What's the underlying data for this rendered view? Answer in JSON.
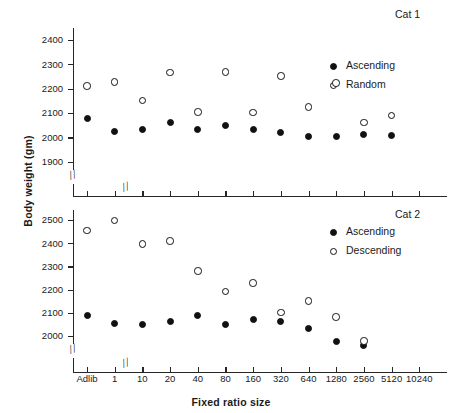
{
  "figure": {
    "ylabel": "Body weight (gm)",
    "xlabel": "Fixed ratio size",
    "axis_break_glyph": "//"
  },
  "chart_data": [
    {
      "type": "scatter",
      "title": "Cat 1",
      "xlabel": "Fixed ratio size",
      "ylabel": "Body weight (gm)",
      "categories": [
        "Adlib",
        "1",
        "10",
        "20",
        "40",
        "80",
        "160",
        "320",
        "640",
        "1280",
        "2560",
        "5120",
        "10240"
      ],
      "yticks": [
        1900,
        2000,
        2100,
        2200,
        2300,
        2400
      ],
      "ylim": [
        1860,
        2450
      ],
      "grid": false,
      "axis_break_y": true,
      "axis_break_x_after": "1",
      "legend_position": "upper-right",
      "series": [
        {
          "name": "Ascending",
          "marker": "filled-circle",
          "values": [
            2080,
            2025,
            2033,
            2062,
            2033,
            2050,
            2036,
            2021,
            2006,
            2007,
            2013,
            2010,
            null
          ]
        },
        {
          "name": "Random",
          "marker": "open-circle",
          "values": [
            2212,
            2228,
            2153,
            2268,
            2105,
            2269,
            2103,
            2253,
            2126,
            2224,
            2063,
            2091,
            null
          ]
        }
      ],
      "annotations": [
        {
          "text": "Ascending and Random overlap near 1900 at x=5120",
          "x": "5120",
          "y": 1900
        }
      ]
    },
    {
      "type": "scatter",
      "title": "Cat 2",
      "xlabel": "Fixed ratio size",
      "ylabel": "Body weight (gm)",
      "categories": [
        "Adlib",
        "1",
        "10",
        "20",
        "40",
        "80",
        "160",
        "320",
        "640",
        "1280",
        "2560",
        "5120",
        "10240"
      ],
      "yticks": [
        2000,
        2100,
        2200,
        2300,
        2400,
        2500
      ],
      "ylim": [
        1950,
        2545
      ],
      "grid": false,
      "axis_break_y": true,
      "axis_break_x_after": "1",
      "legend_position": "upper-right",
      "series": [
        {
          "name": "Ascending",
          "marker": "filled-circle",
          "values": [
            2091,
            2054,
            2052,
            2064,
            2088,
            2051,
            2073,
            2064,
            2032,
            1978,
            1962,
            null,
            null
          ]
        },
        {
          "name": "Descending",
          "marker": "open-circle",
          "values": [
            2457,
            2499,
            2399,
            2412,
            2281,
            2194,
            2231,
            2102,
            2153,
            2083,
            1981,
            null,
            null
          ]
        }
      ]
    }
  ]
}
